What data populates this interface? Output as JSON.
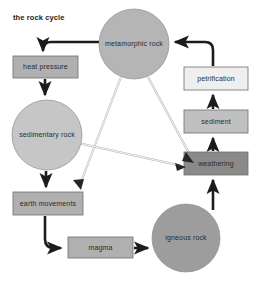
{
  "title": "the rock cycle",
  "canvas": {
    "width": 260,
    "height": 285,
    "background": "#ffffff"
  },
  "palette": {
    "box_mid_gray": "#b0b0b0",
    "box_light_gray": "#d9d9d9",
    "box_pale": "#efefef",
    "box_dark_gray": "#8a8a8a",
    "circle_light": "#c6c6c6",
    "circle_mid": "#b5b5b5",
    "circle_dark": "#9d9d9d",
    "arrow_dark": "#1c1c1c",
    "arrow_outline": "#b4b4b4",
    "border_gray": "#6e6e6e",
    "text": "#2b2b2b"
  },
  "nodes": [
    {
      "id": "metamorphic-rock",
      "label": "metamorphic rock",
      "shape": "circle",
      "cx": 134,
      "cy": 44,
      "r": 35,
      "fill": "#b5b5b5"
    },
    {
      "id": "heat-pressure",
      "label": "heat pressure",
      "shape": "box",
      "x": 13,
      "y": 56,
      "w": 65,
      "h": 22,
      "fill": "#b0b0b0"
    },
    {
      "id": "petrification",
      "label": "petrification",
      "shape": "box",
      "x": 184,
      "y": 67,
      "w": 64,
      "h": 23,
      "fill": "#efefef"
    },
    {
      "id": "sedimentary-rock",
      "label": "sedimentary rock",
      "shape": "circle",
      "cx": 47,
      "cy": 135,
      "r": 35,
      "fill": "#c6c6c6"
    },
    {
      "id": "sediment",
      "label": "sediment",
      "shape": "box",
      "x": 184,
      "y": 110,
      "w": 64,
      "h": 23,
      "fill": "#c0c0c0"
    },
    {
      "id": "weathering",
      "label": "weathering",
      "shape": "box",
      "x": 184,
      "y": 152,
      "w": 64,
      "h": 23,
      "fill": "#8a8a8a"
    },
    {
      "id": "earth-movements",
      "label": "earth movements",
      "shape": "box",
      "x": 13,
      "y": 192,
      "w": 70,
      "h": 23,
      "fill": "#b0b0b0"
    },
    {
      "id": "magma",
      "label": "magma",
      "shape": "box",
      "x": 68,
      "y": 237,
      "w": 65,
      "h": 21,
      "fill": "#b0b0b0"
    },
    {
      "id": "igneous-rock",
      "label": "igneous rock",
      "shape": "circle",
      "cx": 186,
      "cy": 238,
      "r": 34,
      "fill": "#9d9d9d"
    }
  ],
  "edges": [
    {
      "id": "metamorphic-to-heat-pressure",
      "from": "metamorphic rock",
      "to": "heat pressure",
      "style": "thick"
    },
    {
      "id": "heat-pressure-to-sedimentary",
      "from": "heat pressure",
      "to": "sedimentary rock",
      "style": "thick"
    },
    {
      "id": "sedimentary-to-earth-movements",
      "from": "sedimentary rock",
      "to": "earth movements",
      "style": "thick"
    },
    {
      "id": "earth-movements-to-magma",
      "from": "earth movements",
      "to": "magma",
      "style": "thick"
    },
    {
      "id": "magma-to-igneous",
      "from": "magma",
      "to": "igneous rock",
      "style": "thick"
    },
    {
      "id": "igneous-to-weathering",
      "from": "igneous rock",
      "to": "weathering",
      "style": "thick"
    },
    {
      "id": "weathering-to-sediment",
      "from": "weathering",
      "to": "sediment",
      "style": "thick"
    },
    {
      "id": "sediment-to-petrification",
      "from": "sediment",
      "to": "petrification",
      "style": "thick"
    },
    {
      "id": "petrification-to-metamorphic",
      "from": "petrification",
      "to": "metamorphic rock",
      "style": "thick"
    },
    {
      "id": "metamorphic-to-weathering",
      "from": "metamorphic rock",
      "to": "weathering",
      "style": "thin-outline"
    },
    {
      "id": "metamorphic-to-earth-movements",
      "from": "metamorphic rock",
      "to": "earth movements",
      "style": "thin-outline"
    },
    {
      "id": "sedimentary-to-weathering",
      "from": "sedimentary rock",
      "to": "weathering",
      "style": "thin-outline"
    }
  ]
}
